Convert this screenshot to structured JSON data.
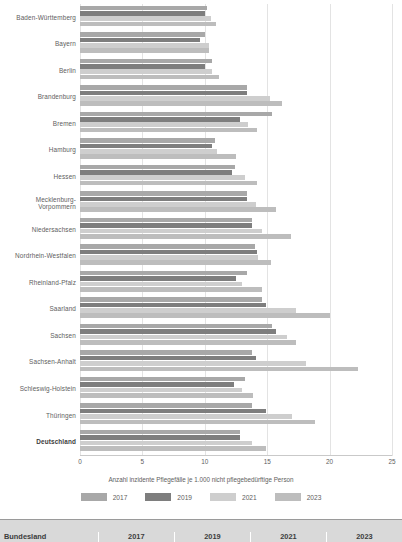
{
  "chart_data": {
    "type": "bar",
    "orientation": "horizontal",
    "title": "",
    "xlabel": "Anzahl inzidente Pflegefälle je 1.000 nicht pflegebedürftige Person",
    "ylabel": "",
    "xlim": [
      0,
      25
    ],
    "xticks": [
      0,
      5,
      10,
      15,
      20,
      25
    ],
    "grid": true,
    "legend_position": "bottom",
    "categories": [
      "Baden-Württemberg",
      "Bayern",
      "Berlin",
      "Brandenburg",
      "Bremen",
      "Hamburg",
      "Hessen",
      "Mecklenburg-Vorpommern",
      "Niedersachsen",
      "Nordrhein-Westfalen",
      "Rheinland-Pfalz",
      "Saarland",
      "Sachsen",
      "Sachsen-Anhalt",
      "Schleswig-Holstein",
      "Thüringen",
      "Deutschland"
    ],
    "series": [
      {
        "name": "2017",
        "color": "#a8a8a8",
        "values": [
          10.2,
          10.0,
          10.6,
          13.4,
          15.4,
          10.8,
          12.4,
          13.4,
          13.8,
          14.0,
          13.4,
          14.6,
          15.4,
          13.8,
          13.2,
          13.8,
          12.8
        ]
      },
      {
        "name": "2019",
        "color": "#7e7e7e",
        "values": [
          10.0,
          9.6,
          10.0,
          13.4,
          12.8,
          10.6,
          12.2,
          13.4,
          13.8,
          14.2,
          12.5,
          14.9,
          15.7,
          14.1,
          12.3,
          14.9,
          12.8
        ]
      },
      {
        "name": "2021",
        "color": "#cecece",
        "values": [
          10.5,
          10.3,
          10.6,
          15.2,
          13.5,
          11.0,
          13.2,
          14.1,
          14.6,
          14.3,
          13.0,
          17.3,
          16.6,
          18.1,
          13.0,
          17.0,
          13.8
        ]
      },
      {
        "name": "2023",
        "color": "#bdbdbd",
        "values": [
          10.9,
          10.3,
          11.1,
          16.2,
          14.2,
          12.5,
          14.2,
          15.7,
          16.9,
          15.3,
          14.6,
          20.0,
          17.3,
          22.3,
          13.9,
          18.8,
          14.9
        ]
      }
    ],
    "highlight_category": "Deutschland"
  },
  "legend": {
    "items": [
      {
        "label": "2017",
        "color": "#a8a8a8"
      },
      {
        "label": "2019",
        "color": "#7e7e7e"
      },
      {
        "label": "2021",
        "color": "#cecece"
      },
      {
        "label": "2023",
        "color": "#bdbdbd"
      }
    ]
  },
  "table_header": {
    "columns": [
      "Bundesland",
      "2017",
      "2019",
      "2021",
      "2023"
    ]
  }
}
